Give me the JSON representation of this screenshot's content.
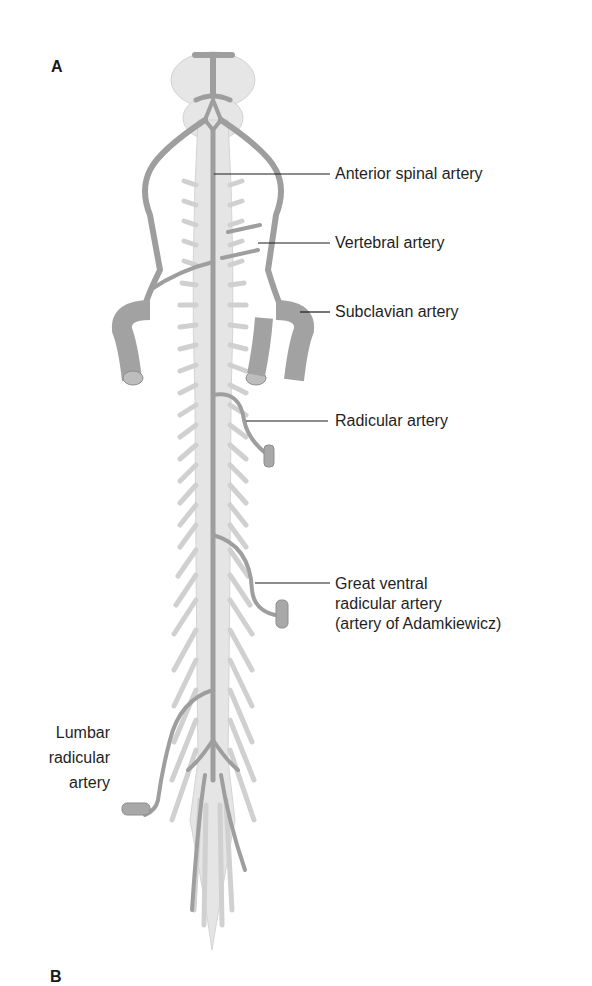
{
  "figure": {
    "panel_labels": {
      "a": "A",
      "b": "B"
    },
    "colors": {
      "artery": "#9e9e9e",
      "cord": "#e4e4e4",
      "nerve_root": "#d0d0d0",
      "leader_line": "#1a1a1a",
      "text": "#1f1f1f"
    },
    "labels": [
      {
        "id": "anterior-spinal",
        "text": "Anterior spinal artery"
      },
      {
        "id": "vertebral",
        "text": "Vertebral artery"
      },
      {
        "id": "subclavian",
        "text": "Subclavian artery"
      },
      {
        "id": "radicular",
        "text": "Radicular artery"
      },
      {
        "id": "great-ventral-1",
        "text": "Great ventral"
      },
      {
        "id": "great-ventral-2",
        "text": "radicular artery"
      },
      {
        "id": "great-ventral-3",
        "text": "(artery of Adamkiewicz)"
      },
      {
        "id": "lumbar-1",
        "text": "Lumbar"
      },
      {
        "id": "lumbar-2",
        "text": "radicular"
      },
      {
        "id": "lumbar-3",
        "text": "artery"
      }
    ]
  }
}
